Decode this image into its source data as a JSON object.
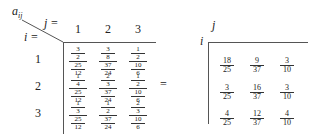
{
  "left_table": {
    "corner_label": "a_ij",
    "col_label": "j =",
    "row_label": "i =",
    "col_headers": [
      "1",
      "2",
      "3"
    ],
    "row_headers": [
      "1",
      "2",
      "3"
    ],
    "cells": [
      [
        {
          "n1": "3",
          "d1": "2",
          "n2": "25",
          "d2": "12"
        },
        {
          "n1": "3",
          "d1": "8",
          "n2": "37",
          "d2": "24"
        },
        {
          "n1": "1",
          "d1": "2",
          "n2": "10",
          "d2": "6"
        }
      ],
      [
        {
          "n1": "1",
          "d1": "4",
          "n2": "25",
          "d2": "12"
        },
        {
          "n1": "2",
          "d1": "3",
          "n2": "37",
          "d2": "24"
        },
        {
          "n1": "1",
          "d1": "2",
          "n2": "10",
          "d2": "6"
        }
      ],
      [
        {
          "n1": "1",
          "d1": "3",
          "n2": "25",
          "d2": "12"
        },
        {
          "n1": "1",
          "d1": "2",
          "n2": "37",
          "d2": "24"
        },
        {
          "n1": "2",
          "d1": "3",
          "n2": "10",
          "d2": "6"
        }
      ]
    ]
  },
  "equals": "=",
  "right_table": {
    "col_label": "j",
    "row_label": "i",
    "cells": [
      [
        {
          "n": "18",
          "d": "25"
        },
        {
          "n": "9",
          "d": "37"
        },
        {
          "n": "3",
          "d": "10"
        }
      ],
      [
        {
          "n": "3",
          "d": "25"
        },
        {
          "n": "16",
          "d": "37"
        },
        {
          "n": "3",
          "d": "10"
        }
      ],
      [
        {
          "n": "4",
          "d": "25"
        },
        {
          "n": "12",
          "d": "37"
        },
        {
          "n": "4",
          "d": "10"
        }
      ]
    ]
  }
}
